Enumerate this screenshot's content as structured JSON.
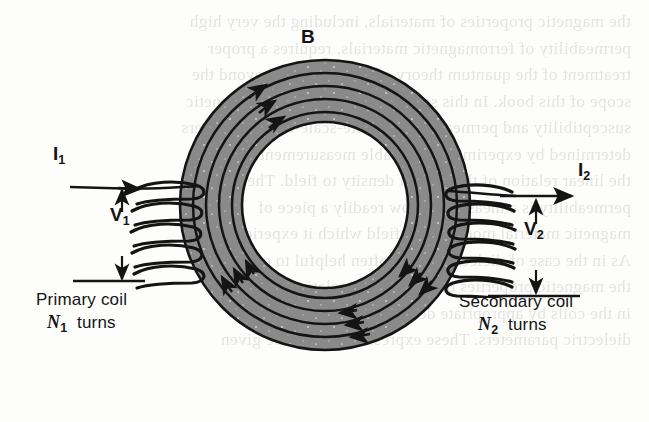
{
  "figure": {
    "type": "toroidal-transformer-schematic",
    "background_color": "#fdfdfc",
    "core_fill_color": "#8a8a8a",
    "ink_color": "#141414"
  },
  "labels": {
    "magnetic_field": "B",
    "primary_current": "I",
    "primary_current_sub": "1",
    "secondary_current": "I",
    "secondary_current_sub": "2",
    "primary_voltage": "V",
    "primary_voltage_sub": "1",
    "secondary_voltage": "V",
    "secondary_voltage_sub": "2",
    "primary_coil": "Primary coil",
    "primary_turns_symbol": "N",
    "primary_turns_sub": "1",
    "primary_turns_word": "turns",
    "secondary_coil": "Secondary coil",
    "secondary_turns_symbol": "N",
    "secondary_turns_sub": "2",
    "secondary_turns_word": "turns"
  },
  "geometry": {
    "center_x": 325,
    "center_y": 205,
    "core_outer_radius": 145,
    "core_inner_radius": 83,
    "field_line_radii": [
      93,
      106,
      119,
      132
    ],
    "field_line_count": 4,
    "primary_turn_count": 5,
    "secondary_turn_count": 6
  },
  "bleed_text_lines": [
    "the magnetic properties of materials, including the very high",
    "permeability  of  ferromagnetic  materials,  requires  a  proper",
    "treatment of the quantum theory of solids, and is beyond the",
    "scope of this book. In this section we shall treat the magnetic",
    "susceptibility and permeability as finite-scale-thin parameters",
    "determined by experiment at suitable measurement.",
    "the linear relation of the current density to field. The",
    "permeability  is  a  measure  of  how  readily  a  piece  of",
    "magnetic material modifies the field which it experiences.",
    "As in the case of dielectrics, it is often helpful to express",
    "the magnetic properties of materials in relative terms.",
    "in the coils by appropriate design about the relation",
    "dielectric   parameters.   These  expressions  which  be  given"
  ]
}
